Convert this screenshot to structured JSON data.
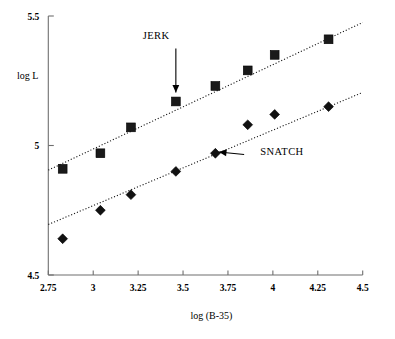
{
  "chart_data": {
    "type": "scatter",
    "title": "",
    "xlabel": "log (B-35)",
    "ylabel": "log L",
    "xlim": [
      2.75,
      4.5
    ],
    "ylim": [
      4.5,
      5.5
    ],
    "xticks": [
      "2.75",
      "3",
      "3.25",
      "3.5",
      "3.75",
      "4",
      "4.25",
      "4.5"
    ],
    "xtick_values": [
      2.75,
      3,
      3.25,
      3.5,
      3.75,
      4,
      4.25,
      4.5
    ],
    "yticks": [
      "5.5",
      "5",
      "4.5"
    ],
    "ytick_values": [
      5.5,
      5,
      4.5
    ],
    "grid": false,
    "legend": "annotations",
    "series": [
      {
        "name": "JERK",
        "marker": "square",
        "color": "#1a1a1a",
        "x": [
          2.83,
          3.04,
          3.21,
          3.46,
          3.68,
          3.86,
          4.01,
          4.31
        ],
        "y": [
          4.91,
          4.97,
          5.07,
          5.17,
          5.23,
          5.29,
          5.35,
          5.41
        ],
        "fit": {
          "x": [
            2.75,
            4.5
          ],
          "y": [
            4.905,
            5.475
          ]
        },
        "annotation": {
          "label": "JERK",
          "label_x": 3.35,
          "label_y": 5.425,
          "arrow_from_x": 3.46,
          "arrow_from_y": 5.375,
          "arrow_to_x": 3.46,
          "arrow_to_y": 5.205
        }
      },
      {
        "name": "SNATCH",
        "marker": "diamond",
        "color": "#111111",
        "x": [
          2.83,
          3.04,
          3.21,
          3.46,
          3.68,
          3.86,
          4.01,
          4.31
        ],
        "y": [
          4.64,
          4.75,
          4.81,
          4.9,
          4.97,
          5.08,
          5.12,
          5.15
        ],
        "fit": {
          "x": [
            2.75,
            4.5
          ],
          "y": [
            4.695,
            5.205
          ]
        },
        "annotation": {
          "label": "SNATCH",
          "label_x": 3.93,
          "label_y": 4.975,
          "arrow_from_x": 3.84,
          "arrow_from_y": 4.965,
          "arrow_to_x": 3.7,
          "arrow_to_y": 4.975
        }
      }
    ]
  }
}
